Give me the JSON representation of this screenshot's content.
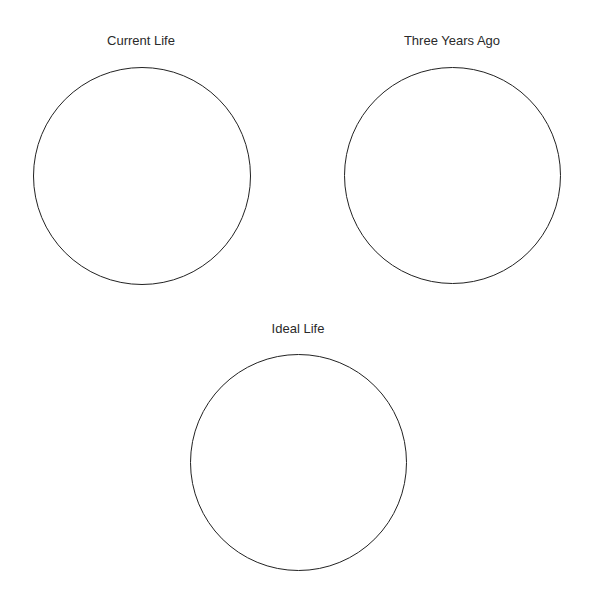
{
  "diagram": {
    "type": "comparison-circles",
    "line_color": "#222222",
    "text_color": "#2a2a2a",
    "background": "#ffffff",
    "circles": [
      {
        "label": "Current Life",
        "center": [
          142,
          176
        ],
        "radius": 109
      },
      {
        "label": "Three Years Ago",
        "center": [
          452,
          176
        ],
        "radius": 108
      },
      {
        "label": "Ideal Life",
        "center": [
          298,
          462
        ],
        "radius": 108
      }
    ]
  }
}
